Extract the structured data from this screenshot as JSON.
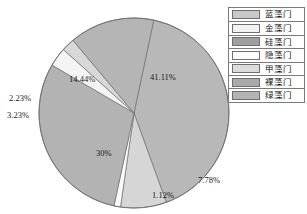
{
  "chart_data": {
    "type": "pie",
    "title": "",
    "categories": [
      "蓝藻门",
      "金藻门",
      "硅藻门",
      "隐藻门",
      "甲藻门",
      "裸藻门",
      "绿藻门"
    ],
    "values": [
      41.11,
      7.78,
      1.12,
      30,
      3.23,
      2.23,
      14.44
    ],
    "value_labels": [
      "41.11%",
      "7.78%",
      "1.12%",
      "30%",
      "3.23%",
      "2.23%",
      "14.44%"
    ],
    "colors": [
      "#b8b8b8",
      "#d6d6d6",
      "#9a9a9a",
      "#fbfbfb",
      "#e2e2e2",
      "#a8a8a8",
      "#b0b0b0"
    ],
    "legend_position": "right",
    "grid": false,
    "slices": [
      {
        "label": "蓝藻门",
        "value": 41.11,
        "value_label": "41.11%",
        "color": "#b8b8b8"
      },
      {
        "label": "金藻门",
        "value": 7.78,
        "value_label": "7.78%",
        "color": "#d6d6d6"
      },
      {
        "label": "硅藻门",
        "value": 1.12,
        "value_label": "1.12%",
        "color": "#fafafa"
      },
      {
        "label": "隐藻门",
        "value": 30,
        "value_label": "30%",
        "color": "#b3b3b3"
      },
      {
        "label": "甲藻门",
        "value": 3.23,
        "value_label": "3.23%",
        "color": "#f4f4f4"
      },
      {
        "label": "裸藻门",
        "value": 2.23,
        "value_label": "2.23%",
        "color": "#d8d8d8"
      },
      {
        "label": "绿藻门",
        "value": 14.44,
        "value_label": "14.44%",
        "color": "#b5b5b5"
      }
    ]
  },
  "legend": {
    "items": [
      {
        "label": "蓝藻门",
        "color": "#c9c9c9"
      },
      {
        "label": "金藻门",
        "color": "#f2f2f2"
      },
      {
        "label": "硅藻门",
        "color": "#9e9e9e"
      },
      {
        "label": "隐藻门",
        "color": "#fcfcfc"
      },
      {
        "label": "甲藻门",
        "color": "#dcdcdc"
      },
      {
        "label": "裸藻门",
        "color": "#aaaaaa"
      },
      {
        "label": "绿藻门",
        "color": "#b4b4b4"
      }
    ]
  },
  "labels": {
    "p41": "41.11%",
    "p778": "7.78%",
    "p112": "1.12%",
    "p30": "30%",
    "p323": "3.23%",
    "p223": "2.23%",
    "p1444": "14.44%"
  }
}
